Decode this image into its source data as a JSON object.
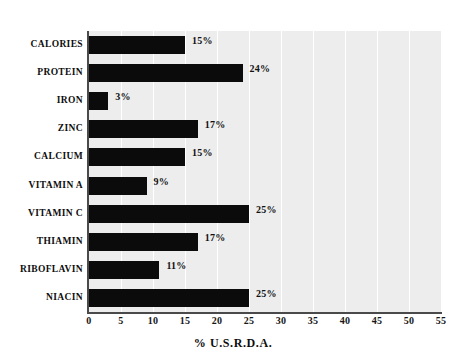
{
  "chart_data": {
    "type": "bar",
    "orientation": "horizontal",
    "title": "",
    "xlabel": "% U.S.R.D.A.",
    "ylabel": "",
    "xlim": [
      0,
      55
    ],
    "grid": true,
    "legend": null,
    "categories": [
      "CALORIES",
      "PROTEIN",
      "IRON",
      "ZINC",
      "CALCIUM",
      "VITAMIN A",
      "VITAMIN C",
      "THIAMIN",
      "RIBOFLAVIN",
      "NIACIN"
    ],
    "values": [
      15,
      24,
      3,
      17,
      15,
      9,
      25,
      17,
      11,
      25
    ],
    "value_labels": [
      "15%",
      "24%",
      "3%",
      "17%",
      "15%",
      "9%",
      "25%",
      "17%",
      "11%",
      "25%"
    ],
    "xticks": [
      0,
      5,
      10,
      15,
      20,
      25,
      30,
      35,
      40,
      45,
      50,
      55
    ],
    "xtick_labels": [
      "0",
      "5",
      "10",
      "15",
      "20",
      "25",
      "30",
      "35",
      "40",
      "45",
      "50",
      "55"
    ],
    "colors": {
      "bar": "#0b0b0b",
      "plot_background": "#ededed",
      "page_background": "#ffffff",
      "gridline": "#ffffff",
      "axis": "#4a4a4a",
      "text": "#0d0d0d"
    }
  }
}
